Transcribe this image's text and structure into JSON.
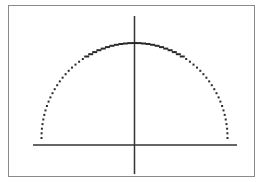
{
  "chart_data": {
    "type": "scatter",
    "title": "",
    "xlabel": "",
    "ylabel": "",
    "function": "y = sqrt(r^2 - x^2)",
    "radius": 1,
    "xlim": [
      -1.15,
      1.15
    ],
    "ylim": [
      -0.35,
      1.05
    ],
    "grid": false,
    "legend": null,
    "x": [
      -1.0,
      -0.95,
      -0.9,
      -0.8,
      -0.7,
      -0.6,
      -0.5,
      -0.4,
      -0.3,
      -0.2,
      -0.1,
      0.0,
      0.1,
      0.2,
      0.3,
      0.4,
      0.5,
      0.6,
      0.7,
      0.8,
      0.9,
      0.95,
      1.0
    ],
    "y": [
      0.0,
      0.31,
      0.44,
      0.6,
      0.71,
      0.8,
      0.87,
      0.92,
      0.95,
      0.98,
      0.99,
      1.0,
      0.99,
      0.98,
      0.95,
      0.92,
      0.87,
      0.8,
      0.71,
      0.6,
      0.44,
      0.31,
      0.0
    ]
  },
  "colors": {
    "frame": "#8a8a8a",
    "axes": "#333333",
    "points": "#2a2a2a",
    "background": "#ffffff"
  }
}
